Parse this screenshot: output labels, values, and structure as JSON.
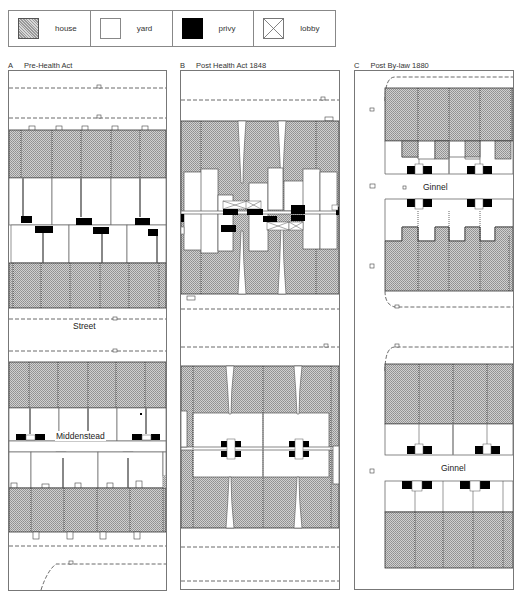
{
  "legend": {
    "items": [
      {
        "key": "house",
        "label": "house"
      },
      {
        "key": "yard",
        "label": "yard"
      },
      {
        "key": "privy",
        "label": "privy"
      },
      {
        "key": "lobby",
        "label": "lobby"
      }
    ]
  },
  "panels": [
    {
      "letter": "A",
      "title": "Pre-Health Act",
      "labels": {
        "street": "Street",
        "middenstead": "Middenstead"
      }
    },
    {
      "letter": "B",
      "title": "Post Health Act 1848"
    },
    {
      "letter": "C",
      "title": "Post By-law 1880",
      "labels": {
        "ginnel_upper": "Ginnel",
        "ginnel_lower": "Ginnel"
      }
    }
  ],
  "colors": {
    "house_fill": "#c4c4c4",
    "yard_fill": "#ffffff",
    "privy_fill": "#000000",
    "outline": "#555555"
  }
}
